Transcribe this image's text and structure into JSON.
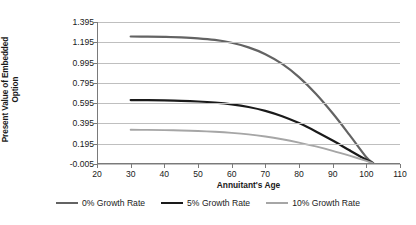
{
  "chart_data": {
    "type": "line",
    "title": "",
    "xlabel": "Annuitant's Age",
    "ylabel_lines": [
      "Present Value of Embedded",
      "Option"
    ],
    "ylabel": "Present Value of Embedded Option",
    "xlim": [
      20,
      110
    ],
    "ylim": [
      -0.005,
      1.395
    ],
    "xticks": [
      20,
      30,
      40,
      50,
      60,
      70,
      80,
      90,
      100,
      110
    ],
    "xtick_labels": [
      "20",
      "30",
      "40",
      "50",
      "60",
      "70",
      "80",
      "90",
      "100",
      "110"
    ],
    "yticks": [
      -0.005,
      0.195,
      0.395,
      0.595,
      0.795,
      0.995,
      1.195,
      1.395
    ],
    "ytick_labels": [
      "-0.005",
      "0.195",
      "0.395",
      "0.595",
      "0.795",
      "0.995",
      "1.195",
      "1.395"
    ],
    "grid": "horizontal",
    "legend_position": "bottom",
    "x": [
      30,
      35,
      40,
      45,
      50,
      55,
      60,
      65,
      70,
      75,
      80,
      85,
      90,
      95,
      100,
      102
    ],
    "series": [
      {
        "name": "0% Growth Rate",
        "color": "#636363",
        "values": [
          1.252,
          1.251,
          1.248,
          1.243,
          1.234,
          1.218,
          1.19,
          1.145,
          1.078,
          0.982,
          0.852,
          0.688,
          0.495,
          0.282,
          0.062,
          0.005
        ]
      },
      {
        "name": "5% Growth Rate",
        "color": "#1a1a1a",
        "values": [
          0.625,
          0.624,
          0.622,
          0.618,
          0.611,
          0.6,
          0.583,
          0.557,
          0.519,
          0.466,
          0.398,
          0.316,
          0.226,
          0.13,
          0.036,
          0.004
        ]
      },
      {
        "name": "10% Growth Rate",
        "color": "#a6a6a6",
        "values": [
          0.332,
          0.331,
          0.329,
          0.326,
          0.321,
          0.313,
          0.302,
          0.287,
          0.266,
          0.239,
          0.206,
          0.168,
          0.125,
          0.077,
          0.026,
          0.003
        ]
      }
    ]
  },
  "legend": {
    "items": [
      {
        "label": "0% Growth Rate",
        "color": "#636363"
      },
      {
        "label": "5% Growth Rate",
        "color": "#1a1a1a"
      },
      {
        "label": "10% Growth Rate",
        "color": "#a6a6a6"
      }
    ]
  }
}
